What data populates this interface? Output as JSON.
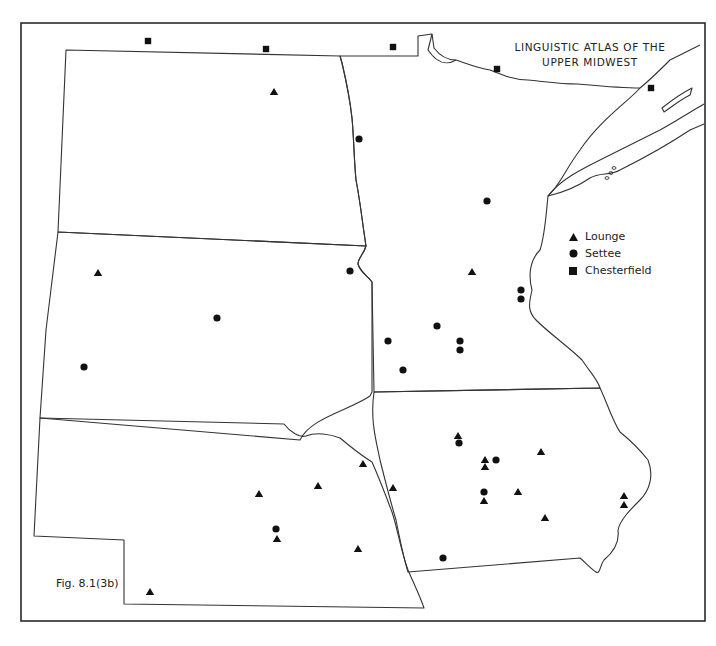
{
  "title": {
    "line1": "LINGUISTIC ATLAS OF THE",
    "line2": "UPPER MIDWEST"
  },
  "figure_label": "Fig. 8.1(3b)",
  "legend": {
    "items": [
      {
        "symbol": "triangle",
        "label": "Lounge"
      },
      {
        "symbol": "circle",
        "label": "Settee"
      },
      {
        "symbol": "square",
        "label": "Chesterfield"
      }
    ]
  },
  "colors": {
    "ink": "#1a1a1a",
    "border": "#2a2a2a",
    "background": "#ffffff"
  },
  "map_data": {
    "regions": [
      "North Dakota",
      "South Dakota",
      "Nebraska",
      "Minnesota",
      "Iowa",
      "Canada (border strip)"
    ],
    "markers": {
      "lounge": [
        [
          274,
          92
        ],
        [
          98,
          273
        ],
        [
          472,
          272
        ],
        [
          458,
          436
        ],
        [
          485,
          460
        ],
        [
          485,
          467
        ],
        [
          541,
          452
        ],
        [
          518,
          492
        ],
        [
          484,
          501
        ],
        [
          545,
          518
        ],
        [
          624,
          496
        ],
        [
          624,
          505
        ],
        [
          393,
          488
        ],
        [
          363,
          464
        ],
        [
          318,
          486
        ],
        [
          259,
          494
        ],
        [
          277,
          539
        ],
        [
          358,
          549
        ],
        [
          150,
          592
        ]
      ],
      "settee": [
        [
          359,
          139
        ],
        [
          487,
          201
        ],
        [
          350,
          271
        ],
        [
          217,
          318
        ],
        [
          84,
          367
        ],
        [
          521,
          290
        ],
        [
          521,
          299
        ],
        [
          437,
          326
        ],
        [
          388,
          341
        ],
        [
          460,
          341
        ],
        [
          460,
          350
        ],
        [
          403,
          370
        ],
        [
          459,
          443
        ],
        [
          496,
          460
        ],
        [
          484,
          492
        ],
        [
          443,
          558
        ],
        [
          276,
          529
        ]
      ],
      "chesterfield": [
        [
          148,
          41
        ],
        [
          266,
          49
        ],
        [
          393,
          47
        ],
        [
          497,
          69
        ],
        [
          651,
          88
        ]
      ]
    }
  }
}
